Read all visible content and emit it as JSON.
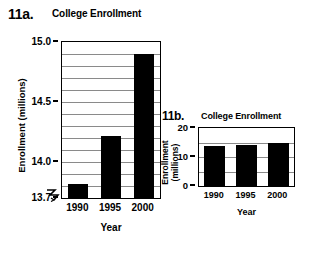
{
  "figure": {
    "panel_a_label": "11a.",
    "panel_b_label": "11b."
  },
  "chart_data": [
    {
      "id": "chart-11a",
      "type": "bar",
      "title": "College Enrollment",
      "xlabel": "Year",
      "ylabel": "Enrollment (millions)",
      "categories": [
        "1990",
        "1995",
        "2000"
      ],
      "values": [
        13.82,
        14.22,
        14.9
      ],
      "ylim": [
        13.7,
        15.0
      ],
      "ytick_labels": [
        "15.0",
        "14.5",
        "14.0",
        "13.7"
      ],
      "ytick_values": [
        15.0,
        14.5,
        14.0,
        13.7
      ],
      "gridlines": [
        14.9,
        14.8,
        14.7,
        14.6,
        14.5,
        14.4,
        14.3,
        14.2,
        14.1,
        14.0,
        13.9,
        13.8
      ],
      "grid": true,
      "axis_break": true,
      "axis_break_symbol": "zigzag",
      "bar_color": "#000000",
      "legend": "none"
    },
    {
      "id": "chart-11b",
      "type": "bar",
      "title": "College Enrollment",
      "xlabel": "Year",
      "ylabel": "Enrollment (millions)",
      "ylabel_line1": "Enrollment",
      "ylabel_line2": "(millions)",
      "categories": [
        "1990",
        "1995",
        "2000"
      ],
      "values": [
        13.82,
        14.22,
        14.9
      ],
      "ylim": [
        0,
        20
      ],
      "ytick_labels": [
        "20",
        "10",
        "0"
      ],
      "ytick_values": [
        20,
        10,
        0
      ],
      "gridlines": [
        15,
        10,
        5
      ],
      "grid": true,
      "axis_break": false,
      "bar_color": "#000000",
      "legend": "none"
    }
  ]
}
